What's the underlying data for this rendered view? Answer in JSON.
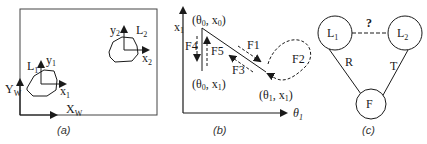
{
  "panels": {
    "a": {
      "caption": "(a)",
      "world_axes": {
        "y_label": "Y",
        "y_sub": "W",
        "x_label": "X",
        "x_sub": "W"
      },
      "link1": {
        "label": "L",
        "label_sub": "1",
        "y_label": "y",
        "y_sub": "1",
        "x_label": "x",
        "x_sub": "1"
      },
      "link2": {
        "label": "L",
        "label_sub": "2",
        "y_label": "y",
        "y_sub": "2",
        "x_label": "x",
        "x_sub": "2"
      }
    },
    "b": {
      "caption": "(b)",
      "y_axis": {
        "label": "x",
        "sub": "1"
      },
      "x_axis": {
        "label": "θ",
        "sub": "1"
      },
      "points": {
        "top": {
          "text_open": "(θ",
          "sub0": "0",
          "text_mid": ", x",
          "sub1": "0",
          "text_close": ")"
        },
        "bottom": {
          "text_open": "(θ",
          "sub0": "0",
          "text_mid": ", x",
          "sub1": "1",
          "text_close": ")"
        },
        "right": {
          "text_open": "(θ",
          "sub0": "1",
          "text_mid": ", x",
          "sub1": "1",
          "text_close": ")"
        }
      },
      "forces": [
        "F1",
        "F2",
        "F3",
        "F4",
        "F5"
      ]
    },
    "c": {
      "caption": "(c)",
      "nodes": {
        "l1": {
          "label": "L",
          "sub": "1"
        },
        "l2": {
          "label": "L",
          "sub": "2"
        },
        "f": {
          "label": "F"
        }
      },
      "edges": {
        "l1_l2": "?",
        "l1_f": "R",
        "l2_f": "T"
      }
    }
  }
}
